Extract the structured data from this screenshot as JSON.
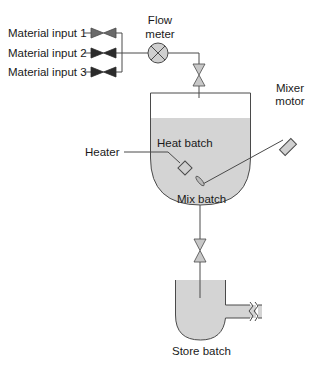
{
  "diagram": {
    "inputs": [
      {
        "label": "Material input 1"
      },
      {
        "label": "Material input 2"
      },
      {
        "label": "Material input 3"
      }
    ],
    "flow_meter": {
      "line1": "Flow",
      "line2": "meter"
    },
    "mixer_motor": {
      "line1": "Mixer",
      "line2": "motor"
    },
    "heater_label": "Heater",
    "heat_batch_label": "Heat batch",
    "mix_batch_label": "Mix batch",
    "store_batch_label": "Store batch",
    "colors": {
      "line": "#4a4a4a",
      "liquid": "#d4d4d4",
      "valve_dark": "#2b2b2b",
      "valve_medium": "#6a6a6a",
      "valve_light": "#c8c8c8",
      "meter_fill": "#cfcfcf"
    }
  }
}
